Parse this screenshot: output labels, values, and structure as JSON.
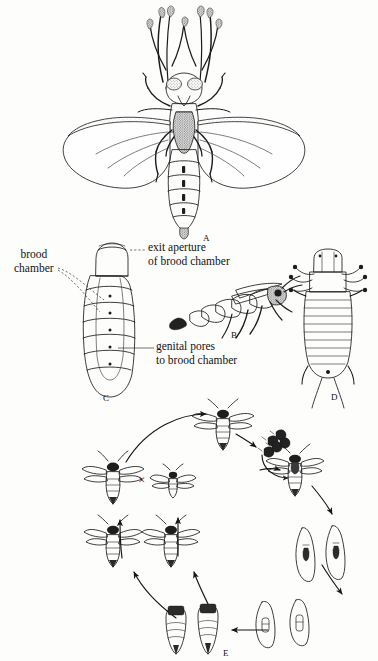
{
  "figure": {
    "background_color": "#fdfdfc",
    "ink_color": "#1c1c1c",
    "width": 378,
    "height": 661
  },
  "panels": [
    {
      "id": "A",
      "letter": "A",
      "caption": "dorsal view of adult male with fan-shaped hind wings"
    },
    {
      "id": "B",
      "letter": "B",
      "caption": "lateral view of adult male"
    },
    {
      "id": "C",
      "letter": "C",
      "caption": "neotenic female showing brood chamber"
    },
    {
      "id": "D",
      "letter": "D",
      "caption": "first instar larva, ventral view"
    },
    {
      "id": "E",
      "letter": "E",
      "caption": "life cycle diagram"
    }
  ],
  "callouts": {
    "brood_chamber": "brood\nchamber",
    "exit_aperture": "exit aperture\nof brood chamber",
    "genital_pores": "genital pores\nto brood chamber"
  },
  "life_cycle": {
    "mating_symbol": "×",
    "stages": [
      {
        "name": "winged-adult-top",
        "label": ""
      },
      {
        "name": "triungulin-larvae-cluster",
        "label": ""
      },
      {
        "name": "host-carrying-adult",
        "label": ""
      },
      {
        "name": "parasitized-host-larva-pair-upper",
        "label": ""
      },
      {
        "name": "parasitized-host-larva-pair-lower",
        "label": ""
      },
      {
        "name": "host-pupa-pair",
        "label": ""
      },
      {
        "name": "emerging-adult-left",
        "label": ""
      },
      {
        "name": "emerging-adult-right",
        "label": ""
      },
      {
        "name": "female-adult",
        "label": ""
      },
      {
        "name": "small-male",
        "label": ""
      }
    ]
  }
}
